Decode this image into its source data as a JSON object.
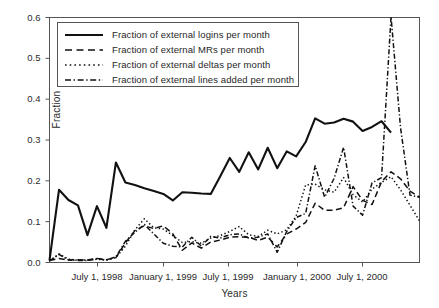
{
  "chart_data": {
    "type": "line",
    "title": "",
    "xlabel": "Years",
    "ylabel": "Fraction",
    "grid": false,
    "legend_position": "upper-left-inside",
    "ylim": [
      0.0,
      0.6
    ],
    "yticks": [
      0.0,
      0.1,
      0.2,
      0.3,
      0.4,
      0.5,
      0.6
    ],
    "ytick_labels": [
      "0.0",
      "0.1",
      "0.2",
      "0.3",
      "0.4",
      "0.5",
      "0.6"
    ],
    "xtick_labels": [
      "July 1, 1998",
      "January 1, 1999",
      "July 1, 1999",
      "January 1, 2000",
      "July 1, 2000"
    ],
    "xtick_positions_months": [
      6,
      12,
      18,
      24,
      30
    ],
    "x_index_range": [
      0,
      39
    ],
    "series": [
      {
        "name": "Fraction of external logins per month",
        "style": "solid",
        "color": "#111111",
        "values": [
          0.005,
          0.178,
          0.153,
          0.14,
          0.067,
          0.138,
          0.085,
          0.245,
          0.196,
          0.19,
          0.182,
          0.175,
          0.168,
          0.152,
          0.172,
          0.171,
          0.169,
          0.168,
          0.211,
          0.256,
          0.222,
          0.27,
          0.228,
          0.281,
          0.231,
          0.272,
          0.26,
          0.295,
          0.353,
          0.34,
          0.343,
          0.352,
          0.345,
          0.322,
          0.332,
          0.346,
          0.318
        ]
      },
      {
        "name": "Fraction of external MRs per month",
        "style": "dashed",
        "color": "#111111",
        "values": [
          0.005,
          0.01,
          0.006,
          0.007,
          0.006,
          0.01,
          0.007,
          0.012,
          0.048,
          0.078,
          0.09,
          0.083,
          0.09,
          0.07,
          0.03,
          0.048,
          0.035,
          0.05,
          0.055,
          0.062,
          0.063,
          0.062,
          0.054,
          0.062,
          0.038,
          0.07,
          0.082,
          0.098,
          0.145,
          0.128,
          0.128,
          0.134,
          0.186,
          0.152,
          0.142,
          0.198,
          0.222,
          0.205,
          0.175,
          0.16
        ]
      },
      {
        "name": "Fraction of external deltas per month",
        "style": "dotted",
        "color": "#111111",
        "values": [
          0.004,
          0.021,
          0.008,
          0.006,
          0.006,
          0.008,
          0.006,
          0.012,
          0.04,
          0.08,
          0.107,
          0.085,
          0.082,
          0.066,
          0.049,
          0.051,
          0.047,
          0.06,
          0.066,
          0.076,
          0.088,
          0.068,
          0.064,
          0.079,
          0.07,
          0.08,
          0.114,
          0.19,
          0.192,
          0.178,
          0.172,
          0.208,
          0.166,
          0.148,
          0.18,
          0.196,
          0.21,
          0.178,
          0.14,
          0.102
        ]
      },
      {
        "name": "Fraction of external lines added per month",
        "style": "dashdot",
        "color": "#111111",
        "values": [
          0.004,
          0.02,
          0.006,
          0.005,
          0.005,
          0.009,
          0.006,
          0.014,
          0.052,
          0.074,
          0.093,
          0.07,
          0.047,
          0.04,
          0.038,
          0.062,
          0.04,
          0.064,
          0.06,
          0.068,
          0.07,
          0.06,
          0.062,
          0.07,
          0.025,
          0.076,
          0.11,
          0.12,
          0.237,
          0.16,
          0.206,
          0.282,
          0.138,
          0.116,
          0.195,
          0.208,
          0.602,
          0.33,
          0.165,
          0.16
        ]
      }
    ]
  },
  "legend": {
    "entries": [
      {
        "label": "Fraction of external logins per month",
        "style": "solid"
      },
      {
        "label": "Fraction of external MRs per month",
        "style": "dashed"
      },
      {
        "label": "Fraction of external deltas per month",
        "style": "dotted"
      },
      {
        "label": "Fraction of external lines added per month",
        "style": "dashdot"
      }
    ]
  }
}
